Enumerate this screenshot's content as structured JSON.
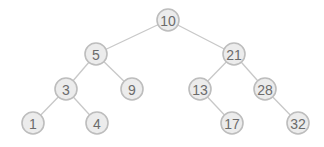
{
  "diagram": {
    "type": "binary-search-tree",
    "node_radius": 11,
    "colors": {
      "background": "#ffffff",
      "node_fill": "#ececec",
      "node_stroke": "#bdbdbd",
      "edge": "#c8c8c8",
      "label": "#6b6b6b"
    },
    "nodes": [
      {
        "id": "n10",
        "label": "10",
        "x": 168,
        "y": 20
      },
      {
        "id": "n5",
        "label": "5",
        "x": 96,
        "y": 54
      },
      {
        "id": "n21",
        "label": "21",
        "x": 234,
        "y": 54
      },
      {
        "id": "n3",
        "label": "3",
        "x": 66,
        "y": 89
      },
      {
        "id": "n9",
        "label": "9",
        "x": 132,
        "y": 89
      },
      {
        "id": "n13",
        "label": "13",
        "x": 200,
        "y": 89
      },
      {
        "id": "n28",
        "label": "28",
        "x": 265,
        "y": 89
      },
      {
        "id": "n1",
        "label": "1",
        "x": 33,
        "y": 123
      },
      {
        "id": "n4",
        "label": "4",
        "x": 97,
        "y": 123
      },
      {
        "id": "n17",
        "label": "17",
        "x": 232,
        "y": 123
      },
      {
        "id": "n32",
        "label": "32",
        "x": 298,
        "y": 123
      }
    ],
    "edges": [
      {
        "from": "n10",
        "to": "n5"
      },
      {
        "from": "n10",
        "to": "n21"
      },
      {
        "from": "n5",
        "to": "n3"
      },
      {
        "from": "n5",
        "to": "n9"
      },
      {
        "from": "n21",
        "to": "n13"
      },
      {
        "from": "n21",
        "to": "n28"
      },
      {
        "from": "n3",
        "to": "n1"
      },
      {
        "from": "n3",
        "to": "n4"
      },
      {
        "from": "n13",
        "to": "n17"
      },
      {
        "from": "n28",
        "to": "n32"
      }
    ]
  }
}
